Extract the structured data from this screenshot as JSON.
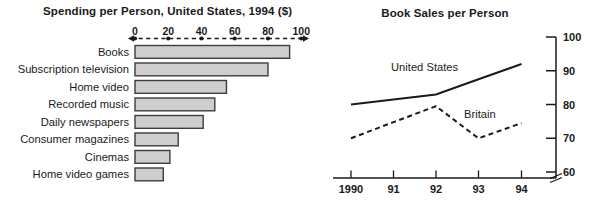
{
  "figure": {
    "background": "#ffffff",
    "ink_color": "#1a1a1a"
  },
  "chart_data": [
    {
      "type": "bar",
      "orientation": "horizontal",
      "title": "Spending per Person, United States, 1994 ($)",
      "categories": [
        "Books",
        "Subscription television",
        "Home video",
        "Recorded music",
        "Daily newspapers",
        "Consumer magazines",
        "Cinemas",
        "Home video games"
      ],
      "values": [
        93,
        80,
        55,
        48,
        41,
        26,
        21,
        17
      ],
      "xlabel": "",
      "ylabel": "",
      "axis": {
        "position": "top",
        "ticks": [
          0,
          20,
          40,
          60,
          80,
          100
        ],
        "range": [
          0,
          100
        ],
        "style": "dashed line with dot markers and arrowheads at both ends"
      },
      "bar_fill": "#cecece",
      "bar_border": "#3d3d3d",
      "grid": false
    },
    {
      "type": "line",
      "title": "Book Sales per Person",
      "x": [
        "1990",
        "91",
        "92",
        "93",
        "94"
      ],
      "series": [
        {
          "name": "United States",
          "values": [
            80,
            81.5,
            83,
            87.5,
            92
          ],
          "style": "solid"
        },
        {
          "name": "Britain",
          "values": [
            70,
            74.8,
            79.5,
            70,
            74.5
          ],
          "style": "dashed"
        }
      ],
      "ylim": [
        60,
        100
      ],
      "yticks": [
        60,
        70,
        80,
        90,
        100
      ],
      "yaxis_position": "right",
      "axis_break_at_bottom": true,
      "legend": "inline labels next to lines",
      "line_color": "#1a1a1a",
      "grid": false
    }
  ]
}
